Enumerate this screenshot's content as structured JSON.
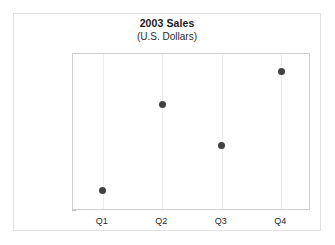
{
  "chart_data": {
    "type": "scatter",
    "title": "2003 Sales",
    "subtitle": "(U.S. Dollars)",
    "xlabel": "",
    "ylabel": "",
    "categories": [
      "Q1",
      "Q2",
      "Q3",
      "Q4"
    ],
    "values": [
      120000,
      202000,
      163000,
      233000
    ],
    "series": [
      {
        "name": "2003 Sales",
        "values": [
          120000,
          202000,
          163000,
          233000
        ]
      }
    ],
    "ylim": [
      100000,
      250000
    ],
    "ytick_step": 25000,
    "ytick_labels": [
      "250,000",
      "225,000",
      "200,000",
      "175,000",
      "150,000",
      "125,000",
      "100,000"
    ],
    "ytick_values": [
      250000,
      225000,
      200000,
      175000,
      150000,
      125000,
      100000
    ],
    "grid": "vertical-only",
    "legend": "none",
    "marker": {
      "shape": "circle",
      "color": "#414141",
      "size_px": 7
    },
    "colors": {
      "marker": "#414141",
      "gridline": "#ededed",
      "plot_border": "#cfcfcf",
      "figure_frame": "#e2e2e2",
      "text": "#1f1f1f",
      "background": "#ffffff"
    }
  }
}
